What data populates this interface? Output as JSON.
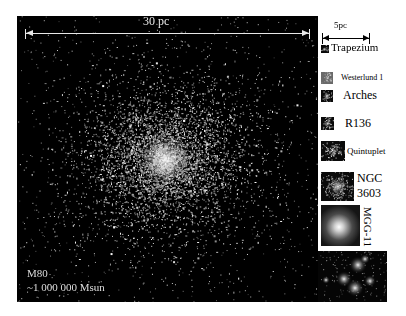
{
  "main_image": {
    "scale_bar_label": "30 pc",
    "cluster_name": "M80",
    "cluster_mass": "~1 000 000 Msun"
  },
  "comparison_panel": {
    "scale_bar_label": "5pc",
    "clusters": [
      {
        "name": "Trapezium"
      },
      {
        "name": "Westerlund 1"
      },
      {
        "name": "Arches"
      },
      {
        "name": "R136"
      },
      {
        "name": "Quintuplet"
      },
      {
        "name": "NGC",
        "name_line2": "3603"
      },
      {
        "name": "MGG-11"
      }
    ]
  },
  "colors": {
    "background": "#ffffff",
    "image_background": "#000000",
    "overlay_text": "#e8e8e8",
    "label_text": "#000000"
  }
}
